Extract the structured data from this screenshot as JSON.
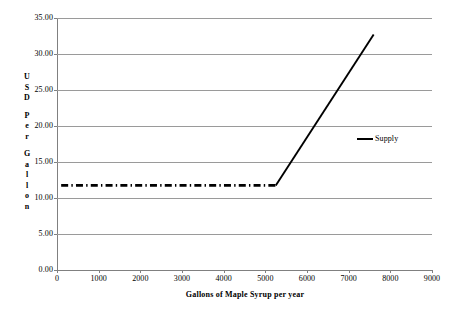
{
  "chart_data": {
    "type": "line",
    "title": "",
    "xlabel": "Gallons of  Maple Syrup per year",
    "ylabel": "USD Per Gallon",
    "ylabel_letters": [
      "U",
      "S",
      "D",
      "",
      "P",
      "e",
      "r",
      "",
      "G",
      "a",
      "l",
      "l",
      "o",
      "n"
    ],
    "xlim": [
      0,
      9000
    ],
    "ylim": [
      0,
      35
    ],
    "xticks": [
      0,
      1000,
      2000,
      3000,
      4000,
      5000,
      6000,
      7000,
      8000,
      9000
    ],
    "xtick_labels": [
      "0",
      "1000",
      "2000",
      "3000",
      "4000",
      "5000",
      "6000",
      "7000",
      "8000",
      "9000"
    ],
    "yticks": [
      0,
      5,
      10,
      15,
      20,
      25,
      30,
      35
    ],
    "ytick_labels": [
      "0.00",
      "5.00",
      "10.00",
      "15.00",
      "20.00",
      "25.00",
      "30.00",
      "35.00"
    ],
    "grid": "horizontal",
    "legend_position": "right-middle",
    "series": [
      {
        "name": "Supply",
        "color": "#000000",
        "flat_segment": {
          "style": "dash-dot",
          "x": [
            100,
            5250
          ],
          "y": [
            11.75,
            11.75
          ]
        },
        "rising_segment": {
          "style": "solid",
          "x": [
            5250,
            7600
          ],
          "y": [
            11.75,
            32.7
          ]
        }
      }
    ],
    "legend": [
      {
        "label": "Supply",
        "color": "#000000",
        "style": "solid"
      }
    ],
    "annotations": []
  },
  "colors": {
    "axis": "#808080",
    "grid": "#9a9a9a",
    "series": "#000000",
    "background": "#ffffff"
  }
}
